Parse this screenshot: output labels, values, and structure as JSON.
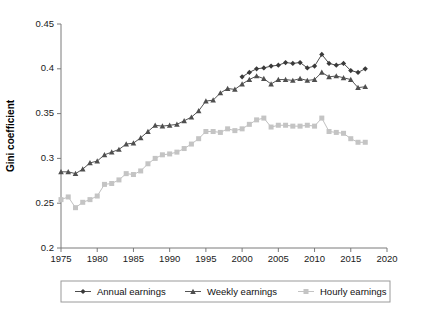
{
  "chart_data": {
    "type": "line",
    "title": "",
    "xlabel": "",
    "ylabel": "Gini coefficient",
    "xlim": [
      1975,
      2020
    ],
    "ylim": [
      0.2,
      0.45
    ],
    "xticks": [
      1975,
      1980,
      1985,
      1990,
      1995,
      2000,
      2005,
      2010,
      2015,
      2020
    ],
    "yticks": [
      0.2,
      0.25,
      0.3,
      0.35,
      0.4,
      0.45
    ],
    "xtick_labels": [
      "1975",
      "1980",
      "1985",
      "1990",
      "1995",
      "2000",
      "2005",
      "2010",
      "2015",
      "2020"
    ],
    "ytick_labels": [
      "0.2",
      "0.25",
      "0.3",
      "0.35",
      "0.4",
      "0.45"
    ],
    "grid": false,
    "legend_position": "below-axes",
    "series": [
      {
        "name": "Annual earnings",
        "marker": "diamond",
        "color": "#3a3a3a",
        "x": [
          2000,
          2001,
          2002,
          2003,
          2004,
          2005,
          2006,
          2007,
          2008,
          2009,
          2010,
          2011,
          2012,
          2013,
          2014,
          2015,
          2016,
          2017
        ],
        "values": [
          0.391,
          0.396,
          0.4,
          0.401,
          0.403,
          0.404,
          0.407,
          0.406,
          0.407,
          0.401,
          0.403,
          0.416,
          0.406,
          0.404,
          0.406,
          0.398,
          0.396,
          0.4
        ]
      },
      {
        "name": "Weekly earnings",
        "marker": "triangle",
        "color": "#4f4f4f",
        "x": [
          1975,
          1976,
          1977,
          1978,
          1979,
          1980,
          1981,
          1982,
          1983,
          1984,
          1985,
          1986,
          1987,
          1988,
          1989,
          1990,
          1991,
          1992,
          1993,
          1994,
          1995,
          1996,
          1997,
          1998,
          1999,
          2000,
          2001,
          2002,
          2003,
          2004,
          2005,
          2006,
          2007,
          2008,
          2009,
          2010,
          2011,
          2012,
          2013,
          2014,
          2015,
          2016,
          2017
        ],
        "values": [
          0.285,
          0.285,
          0.283,
          0.288,
          0.295,
          0.297,
          0.304,
          0.307,
          0.31,
          0.316,
          0.317,
          0.323,
          0.33,
          0.337,
          0.336,
          0.337,
          0.338,
          0.342,
          0.346,
          0.353,
          0.364,
          0.365,
          0.373,
          0.378,
          0.377,
          0.383,
          0.388,
          0.392,
          0.389,
          0.383,
          0.388,
          0.388,
          0.387,
          0.389,
          0.387,
          0.388,
          0.396,
          0.391,
          0.392,
          0.39,
          0.388,
          0.379,
          0.38
        ]
      },
      {
        "name": "Hourly earnings",
        "marker": "square",
        "color": "#c4c4c4",
        "x": [
          1975,
          1976,
          1977,
          1978,
          1979,
          1980,
          1981,
          1982,
          1983,
          1984,
          1985,
          1986,
          1987,
          1988,
          1989,
          1990,
          1991,
          1992,
          1993,
          1994,
          1995,
          1996,
          1997,
          1998,
          1999,
          2000,
          2001,
          2002,
          2003,
          2004,
          2005,
          2006,
          2007,
          2008,
          2009,
          2010,
          2011,
          2012,
          2013,
          2014,
          2015,
          2016,
          2017
        ],
        "values": [
          0.254,
          0.257,
          0.245,
          0.251,
          0.254,
          0.258,
          0.271,
          0.272,
          0.276,
          0.283,
          0.282,
          0.286,
          0.294,
          0.3,
          0.304,
          0.305,
          0.307,
          0.311,
          0.316,
          0.322,
          0.33,
          0.33,
          0.329,
          0.333,
          0.331,
          0.333,
          0.338,
          0.343,
          0.345,
          0.335,
          0.337,
          0.337,
          0.336,
          0.336,
          0.337,
          0.336,
          0.345,
          0.33,
          0.329,
          0.328,
          0.322,
          0.318,
          0.318
        ]
      }
    ]
  },
  "legend": {
    "items": [
      {
        "label": "Annual earnings",
        "marker": "diamond",
        "color": "#3a3a3a"
      },
      {
        "label": "Weekly earnings",
        "marker": "triangle",
        "color": "#4f4f4f"
      },
      {
        "label": "Hourly earnings",
        "marker": "square",
        "color": "#c4c4c4"
      }
    ]
  }
}
